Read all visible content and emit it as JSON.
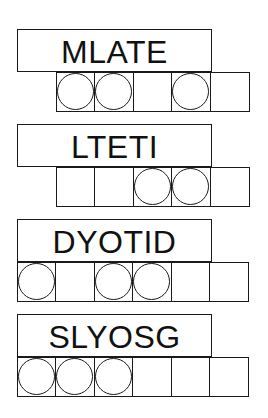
{
  "puzzles": [
    {
      "scrambled": "MLATE",
      "cell_count": 5,
      "cells_offset": true,
      "circled": [
        1,
        2,
        4
      ],
      "answer_letters": [
        "",
        "",
        "",
        "",
        ""
      ]
    },
    {
      "scrambled": "LTETI",
      "cell_count": 5,
      "cells_offset": true,
      "circled": [
        3,
        4
      ],
      "answer_letters": [
        "",
        "",
        "",
        "",
        ""
      ]
    },
    {
      "scrambled": "DYOTID",
      "cell_count": 6,
      "cells_offset": false,
      "circled": [
        1,
        3,
        4
      ],
      "answer_letters": [
        "",
        "",
        "",
        "",
        "",
        ""
      ]
    },
    {
      "scrambled": "SLYOSG",
      "cell_count": 6,
      "cells_offset": false,
      "circled": [
        1,
        2,
        3
      ],
      "answer_letters": [
        "",
        "",
        "",
        "",
        "",
        ""
      ]
    }
  ],
  "colors": {
    "line": "#1a1a1a",
    "text": "#111111",
    "background": "#ffffff"
  }
}
